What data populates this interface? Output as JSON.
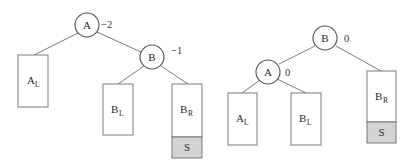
{
  "diagram": {
    "colors": {
      "edge": "#6a6a6a",
      "node_stroke": "#555555",
      "box_stroke": "#6e6e6e",
      "s_fill": "#d4d4d4",
      "background": "#ffffff"
    },
    "before": {
      "nodes": [
        {
          "id": "A",
          "label": "A",
          "balance": "−2"
        },
        {
          "id": "B",
          "label": "B",
          "balance": "−1"
        }
      ],
      "subtrees": [
        {
          "id": "AL",
          "main": "A",
          "sub": "L"
        },
        {
          "id": "BL",
          "main": "B",
          "sub": "L"
        },
        {
          "id": "BR",
          "main": "B",
          "sub": "R"
        }
      ],
      "inserted": {
        "label": "S"
      }
    },
    "after": {
      "nodes": [
        {
          "id": "B",
          "label": "B",
          "balance": "0"
        },
        {
          "id": "A",
          "label": "A",
          "balance": "0"
        }
      ],
      "subtrees": [
        {
          "id": "AL",
          "main": "A",
          "sub": "L"
        },
        {
          "id": "BL",
          "main": "B",
          "sub": "L"
        },
        {
          "id": "BR",
          "main": "B",
          "sub": "R"
        }
      ],
      "inserted": {
        "label": "S"
      }
    }
  }
}
